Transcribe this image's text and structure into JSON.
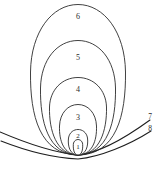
{
  "figure": {
    "kind": "nested-loop-field-line-diagram",
    "background_color": "#ffffff",
    "line_color": "#2b2b2b",
    "width": 157,
    "height": 170,
    "convergence_point": {
      "x": 78,
      "y": 155
    },
    "loops": [
      {
        "id": "loop-1",
        "label": "1",
        "label_x": 78,
        "label_y": 147,
        "top_y": 140,
        "left_x": 73,
        "right_x": 84,
        "path": "M78,155 C73,155 73,146 73.5,143 C74.5,140 77,139.5 78,139.5 C79,139.5 81.5,140 82.5,143 C83,146 83,155 78,155 Z"
      },
      {
        "id": "loop-2",
        "label": "2",
        "label_x": 78,
        "label_y": 136,
        "top_y": 129,
        "left_x": 68,
        "right_x": 89,
        "path": "M78,155 C70,155 67.5,146 68.5,138 C69.5,132 74,129.5 78,129.5 C82,129.5 86.5,132 87.5,138 C88.5,146 86,155 78,155 Z"
      },
      {
        "id": "loop-3",
        "label": "3",
        "label_x": 78,
        "label_y": 118,
        "top_y": 104,
        "left_x": 59,
        "right_x": 98,
        "path": "M78,155 C64,155 59,141 59.5,126 C60,113 68,104.5 78,104.5 C88,104.5 96,113 96.5,126 C97,141 92,155 78,155 Z"
      },
      {
        "id": "loop-4",
        "label": "4",
        "label_x": 78,
        "label_y": 90,
        "top_y": 77,
        "left_x": 49,
        "right_x": 108,
        "path": "M78,155 C56,155 49,130 49.5,107 C50,90 62,77.5 78,77.5 C94,77.5 106,90 106.5,107 C107,130 100,155 78,155 Z"
      },
      {
        "id": "loop-5",
        "label": "5",
        "label_x": 78,
        "label_y": 58,
        "top_y": 40,
        "left_x": 40,
        "right_x": 117,
        "path": "M78,155 C48,155 40,121 40.5,88 C41,60 57,40.5 78,40.5 C99,40.5 115,60 115.5,88 C116,121 108,155 78,155 Z"
      },
      {
        "id": "loop-6",
        "label": "6",
        "label_x": 78,
        "label_y": 17,
        "top_y": 4,
        "left_x": 30,
        "right_x": 127,
        "path": "M78,155 C40,155 30,116 30.5,72 C31,32 52,4.5 78,4.5 C104,4.5 125,32 125.5,72 C126,116 116,155 78,155 Z"
      }
    ],
    "arcs": [
      {
        "id": "arc-7",
        "label": "7",
        "label_x": 150,
        "label_y": 117,
        "left_entry_y": 133,
        "path": "M0,132 C28,144 56,153 78,155 C100,153 128,136 150,120"
      },
      {
        "id": "arc-8",
        "label": "8",
        "label_x": 150,
        "label_y": 129,
        "left_entry_y": 142,
        "path": "M1,141 C29,152 56,158 78,159 C100,157 129,145 151,131"
      }
    ],
    "labels": {
      "loop_1": "1",
      "loop_2": "2",
      "loop_3": "3",
      "loop_4": "4",
      "loop_5": "5",
      "loop_6": "6",
      "arc_7": "7",
      "arc_8": "8"
    }
  }
}
